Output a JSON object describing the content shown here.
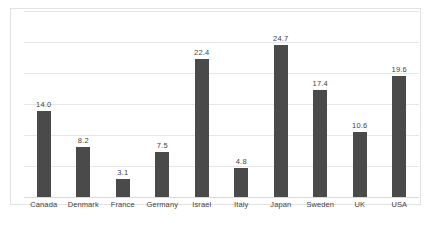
{
  "chart_data": {
    "type": "bar",
    "title": "",
    "subtitle": "",
    "xlabel": "",
    "ylabel": "",
    "categories": [
      "Canada",
      "Denmark",
      "France",
      "Germany",
      "Israel",
      "Italy",
      "Japan",
      "Sweden",
      "UK",
      "USA"
    ],
    "values": [
      14.0,
      8.2,
      3.1,
      7.5,
      22.4,
      4.8,
      24.7,
      17.4,
      10.6,
      19.6
    ],
    "data_labels": [
      "14.0",
      "8.2",
      "3.1",
      "7.5",
      "22.4",
      "4.8",
      "24.7",
      "17.4",
      "10.6",
      "19.6"
    ],
    "ylim": [
      0,
      30
    ],
    "y_tick_values": [
      0,
      5,
      10,
      15,
      20,
      25,
      30
    ],
    "y_tick_labels_visible": false,
    "grid": true,
    "grid_orientation": "horizontal",
    "legend": false,
    "legend_position": "none",
    "series": [
      {
        "name": "",
        "values": [
          14.0,
          8.2,
          3.1,
          7.5,
          22.4,
          4.8,
          24.7,
          17.4,
          10.6,
          19.6
        ]
      }
    ]
  },
  "style": {
    "bar_color": "#4a4a4a",
    "gridline_color": "#e6e6e6",
    "axis_color": "#d9d9d9",
    "frame_border_color": "#e2e2e2",
    "plot_background": "#ffffff",
    "label_color": "#3f3f3f"
  }
}
